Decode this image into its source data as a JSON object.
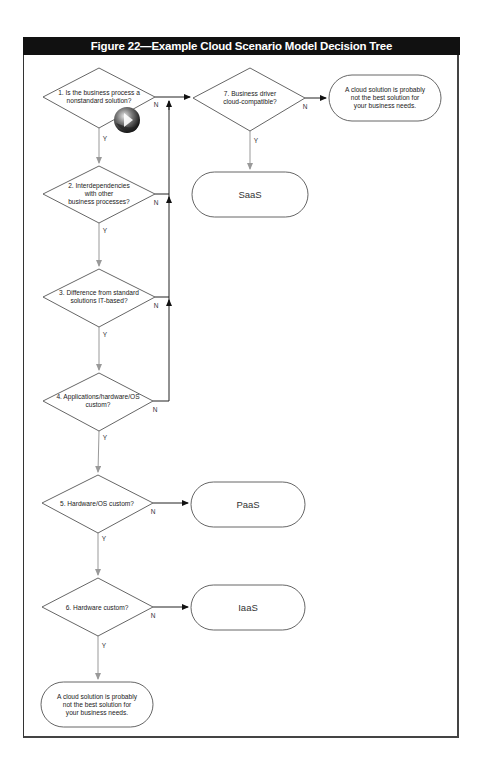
{
  "figure": {
    "title": "Figure 22—Example Cloud Scenario Model Decision Tree"
  },
  "colors": {
    "title_bar_bg": "#111111",
    "title_bar_fg": "#ffffff",
    "yes_connector": "#999999",
    "no_connector": "#222222",
    "shape_stroke": "#555555"
  },
  "decisions": [
    {
      "id": "d1",
      "lines": [
        "1. Is the business process a",
        "nonstandard solution?"
      ],
      "yes_label": "Y",
      "no_label": "N"
    },
    {
      "id": "d2",
      "lines": [
        "2. Interdependencies",
        "with other",
        "business processes?"
      ],
      "yes_label": "Y",
      "no_label": "N"
    },
    {
      "id": "d3",
      "lines": [
        "3. Difference from standard",
        "solutions IT-based?"
      ],
      "yes_label": "Y",
      "no_label": "N"
    },
    {
      "id": "d4",
      "lines": [
        "4. Applications/hardware/OS",
        "custom?"
      ],
      "yes_label": "Y",
      "no_label": "N"
    },
    {
      "id": "d5",
      "lines": [
        "5. Hardware/OS custom?"
      ],
      "yes_label": "Y",
      "no_label": "N"
    },
    {
      "id": "d6",
      "lines": [
        "6. Hardware custom?"
      ],
      "yes_label": "Y",
      "no_label": "N"
    },
    {
      "id": "d7",
      "lines": [
        "7. Business driver",
        "cloud-compatible?"
      ],
      "yes_label": "Y",
      "no_label": "N"
    }
  ],
  "terminals": [
    {
      "id": "t_not_best_top",
      "lines": [
        "A cloud solution is probably",
        "not the best solution for",
        "your business needs."
      ]
    },
    {
      "id": "t_saas",
      "lines": [
        "SaaS"
      ]
    },
    {
      "id": "t_paas",
      "lines": [
        "PaaS"
      ]
    },
    {
      "id": "t_iaas",
      "lines": [
        "IaaS"
      ]
    },
    {
      "id": "t_not_best_bottom",
      "lines": [
        "A cloud solution is probably",
        "not the best solution for",
        "your business needs."
      ]
    }
  ],
  "overlay_icon": {
    "name": "globe-play-icon"
  }
}
